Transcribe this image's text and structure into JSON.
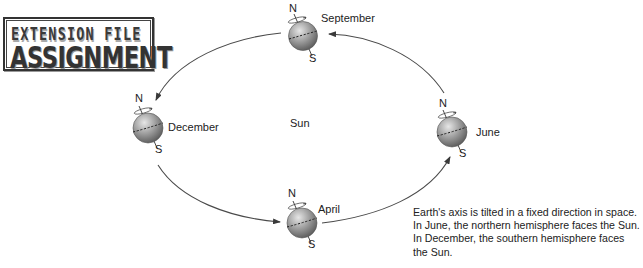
{
  "logo": {
    "line1": "EXTENSION FILE",
    "line2": "ASSIGNMENT"
  },
  "diagram": {
    "center_label": "Sun",
    "orbit_direction": "counterclockwise (June → September → December → April → June)",
    "positions": [
      {
        "month": "September",
        "north": "N",
        "south": "S"
      },
      {
        "month": "December",
        "north": "N",
        "south": "S"
      },
      {
        "month": "April",
        "north": "N",
        "south": "S"
      },
      {
        "month": "June",
        "north": "N",
        "south": "S"
      }
    ]
  },
  "caption": {
    "lines": [
      "Earth's axis is tilted in a fixed direction in space.",
      "In June, the northern hemisphere faces the Sun.",
      "In December, the southern hemisphere faces",
      "the Sun."
    ]
  },
  "colors": {
    "globe_light": "#d8d8d8",
    "globe_dark": "#6e6e6e",
    "orbit_line": "#4a4a4a",
    "text": "#222222"
  }
}
